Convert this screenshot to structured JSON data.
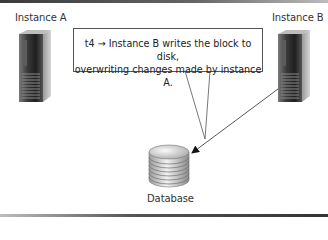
{
  "diagram": {
    "nodes": {
      "instance_a": {
        "label": "Instance A",
        "icon": "server-tower-icon"
      },
      "instance_b": {
        "label": "Instance B",
        "icon": "server-tower-icon"
      },
      "database": {
        "label": "Database",
        "icon": "database-cylinder-icon"
      }
    },
    "callout": {
      "line1": "t4 → Instance B writes the block to disk,",
      "line2": "overwriting changes made by instance A."
    },
    "edges": [
      {
        "from": "instance_b",
        "to": "database",
        "style": "arrow"
      },
      {
        "from": "callout",
        "to": "edge_instance_b_database",
        "style": "callout-pointer"
      }
    ],
    "colors": {
      "border": "#555555",
      "text": "#333333",
      "background": "#ffffff"
    }
  }
}
